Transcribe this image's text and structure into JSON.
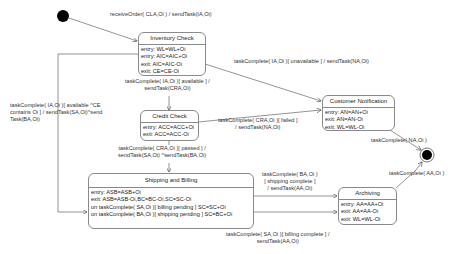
{
  "diagram": {
    "type": "uml-state-machine",
    "states": [
      {
        "id": "inventory_check",
        "name": "Inventory Check",
        "actions": [
          "entry: WL=WL+Oi",
          "entry: AIC=AIC+Oi",
          "exit: AIC=AIC-Oi",
          "exit: CE=CE-Oi"
        ]
      },
      {
        "id": "credit_check",
        "name": "Credit Check",
        "actions": [
          "entry: ACC=ACC+Oi",
          "exit: ACC=ACC-Oi"
        ]
      },
      {
        "id": "customer_notification",
        "name": "Customer Notification",
        "actions": [
          "entry: AN=AN+Oi",
          "exit: AN=AN-Oi",
          "exit: WL=WL-Oi"
        ]
      },
      {
        "id": "shipping_billing",
        "name": "Shipping and Billing",
        "actions": [
          "entry: ASB=ASB+Oi",
          "exit: ASB=ASB-Oi,BC=BC-Oi,SC=SC-Oi",
          "on taskComplete( SA,Oi )[ billing pending ]  SC=SC+Oi",
          "on taskComplete( BA,Oi )[ shipping pending ]  SC=BC+Oi"
        ]
      },
      {
        "id": "archiving",
        "name": "Archiving",
        "actions": [
          "entry: AA=AA+Oi",
          "exit: AA=AA-Oi",
          "exit: WL=WL-Oi"
        ]
      }
    ],
    "transitions": [
      {
        "from": "initial",
        "to": "inventory_check",
        "label": [
          "receiveOrder( CLA,Oi ) / sendTask(IA,Oi)"
        ]
      },
      {
        "from": "inventory_check",
        "to": "customer_notification",
        "label": [
          "taskComplete( IA,Oi )[ unavailable ] / sendTask(NA,Oi)"
        ]
      },
      {
        "from": "inventory_check",
        "to": "credit_check",
        "label": [
          "taskComplete( IA,Oi )[ available ] /",
          "sendTask(CRA,Oi)"
        ]
      },
      {
        "from": "inventory_check",
        "to": "shipping_billing",
        "label": [
          "taskComplete( IA,Oi )[ available ^CE",
          "contains Oi ] / sendTask(SA,Oi)^send",
          "Task(BA,Oi)"
        ]
      },
      {
        "from": "credit_check",
        "to": "customer_notification",
        "label": [
          "taskComplete( CRA,Oi )[ failed ]",
          "/ sendTask(NA,Oi)"
        ]
      },
      {
        "from": "credit_check",
        "to": "shipping_billing",
        "label": [
          "taskComplete( CRA,Oi )[ passed ] /",
          "sendTask(SA,Oi) ^sendTask(BA,Oi)"
        ]
      },
      {
        "from": "customer_notification",
        "to": "final",
        "label": [
          "taskComplete( NA,Oi )"
        ]
      },
      {
        "from": "shipping_billing",
        "to": "archiving",
        "label": [
          "taskComplete( BA,Oi )",
          "[ shipping complete ]",
          "/ sendTask(AA,Oi)"
        ]
      },
      {
        "from": "shipping_billing",
        "to": "archiving",
        "label": [
          "taskComplete( SA,Oi )[ billing complete ] /",
          "sendTask(AA,Oi)"
        ]
      },
      {
        "from": "archiving",
        "to": "final",
        "label": [
          "taskComplete( AA,Oi )"
        ]
      }
    ]
  }
}
